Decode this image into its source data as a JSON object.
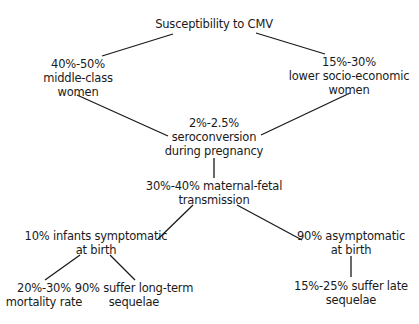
{
  "title": "Susceptibility to CMV",
  "nodes": {
    "root": {
      "lines": [
        "Susceptibility to CMV"
      ]
    },
    "middle_class": {
      "lines": [
        "40%-50%",
        "middle-class",
        "women"
      ]
    },
    "lower_class": {
      "lines": [
        "15%-30%",
        "lower socio-economic",
        "women"
      ]
    },
    "seroconversion": {
      "lines": [
        "2%-2.5%",
        "seroconversion",
        "during pregnancy"
      ]
    },
    "transmission": {
      "lines": [
        "30%-40% maternal-fetal",
        "transmission"
      ]
    },
    "symptomatic": {
      "lines": [
        "10% infants symptomatic",
        "at birth"
      ]
    },
    "asymptomatic": {
      "lines": [
        "90% asymptomatic",
        "at birth"
      ]
    },
    "mortality": {
      "lines": [
        "20%-30%",
        "mortality rate"
      ]
    },
    "long_term": {
      "lines": [
        "90% suffer long-term",
        "sequelae"
      ]
    },
    "late_sequelae": {
      "lines": [
        "15%-25% suffer late",
        "sequelae"
      ]
    }
  },
  "edges": [
    {
      "from": "root",
      "to": "middle_class"
    },
    {
      "from": "root",
      "to": "lower_class"
    },
    {
      "from": "middle_class",
      "to": "seroconversion"
    },
    {
      "from": "lower_class",
      "to": "seroconversion"
    },
    {
      "from": "seroconversion",
      "to": "transmission"
    },
    {
      "from": "transmission",
      "to": "symptomatic"
    },
    {
      "from": "transmission",
      "to": "asymptomatic"
    },
    {
      "from": "symptomatic",
      "to": "mortality"
    },
    {
      "from": "symptomatic",
      "to": "long_term"
    },
    {
      "from": "asymptomatic",
      "to": "late_sequelae"
    }
  ],
  "colors": {
    "line": "#1a1a1a",
    "text": "#1a1a1a",
    "background": "#ffffff"
  }
}
